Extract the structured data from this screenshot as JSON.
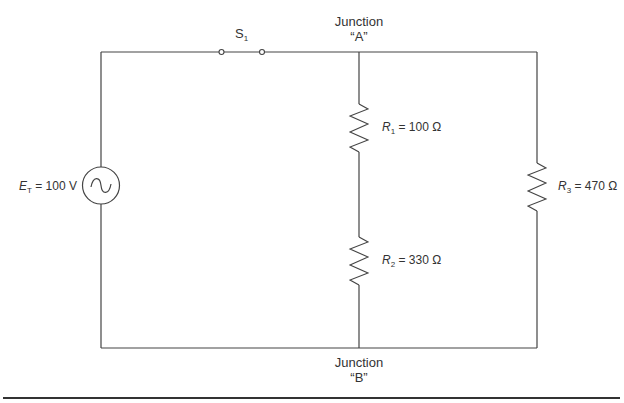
{
  "diagram": {
    "type": "circuit-schematic",
    "source": {
      "symbol": "E",
      "subscript": "T",
      "value": "= 100 V",
      "kind": "AC"
    },
    "switch": {
      "symbol": "S",
      "subscript": "1"
    },
    "junction_a": {
      "line1": "Junction",
      "line2": "“A”"
    },
    "junction_b": {
      "line1": "Junction",
      "line2": "“B”"
    },
    "resistors": [
      {
        "symbol": "R",
        "subscript": "1",
        "value": "= 100 Ω"
      },
      {
        "symbol": "R",
        "subscript": "2",
        "value": "= 330 Ω"
      },
      {
        "symbol": "R",
        "subscript": "3",
        "value": "= 470 Ω"
      }
    ],
    "colors": {
      "line": "#444444",
      "text": "#333333",
      "background": "#ffffff"
    }
  }
}
